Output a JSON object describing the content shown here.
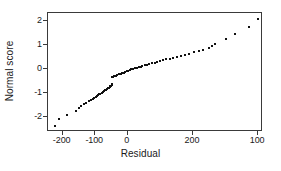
{
  "chart_data": {
    "type": "scatter",
    "title": "",
    "subtitle": "",
    "xlabel": "Residual",
    "ylabel": "Normal score",
    "xlim": [
      -245,
      415
    ],
    "ylim": [
      -2.62,
      2.33
    ],
    "grid": false,
    "legend": null,
    "annotations": [],
    "xticks": [
      {
        "value": -200,
        "label": "-200"
      },
      {
        "value": -100,
        "label": "-100"
      },
      {
        "value": 0,
        "label": "0"
      },
      {
        "value": 200,
        "label": "200"
      },
      {
        "value": 400,
        "label": "100"
      }
    ],
    "yticks": [
      {
        "value": 2,
        "label": "2"
      },
      {
        "value": 1,
        "label": "1"
      },
      {
        "value": 0,
        "label": "0"
      },
      {
        "value": -1,
        "label": "-1"
      },
      {
        "value": -2,
        "label": "-2"
      }
    ],
    "marker": "square",
    "marker_color": "#111111",
    "marker_size": 2,
    "n_points": 75,
    "series": [
      {
        "name": "residual-quantiles",
        "x": [
          -224,
          -210,
          -188,
          -160,
          -151,
          -143,
          -136,
          -128,
          -120,
          -113,
          -108,
          -104,
          -99,
          -96,
          -92,
          -88,
          -84,
          -80,
          -76,
          -73,
          -70,
          -67,
          -64,
          -61,
          -58,
          -56,
          -54,
          -52,
          -50,
          -49,
          -48,
          -46,
          -42,
          -37,
          -32,
          -27,
          -22,
          -17,
          -12,
          -8,
          -4,
          1,
          6,
          11,
          16,
          21,
          27,
          33,
          39,
          45,
          52,
          59,
          66,
          74,
          82,
          90,
          99,
          108,
          118,
          128,
          139,
          150,
          162,
          175,
          188,
          202,
          217,
          232,
          248,
          258,
          268,
          300,
          330,
          372,
          400
        ],
        "y": [
          -2.38,
          -2.07,
          -1.93,
          -1.73,
          -1.62,
          -1.54,
          -1.47,
          -1.41,
          -1.35,
          -1.3,
          -1.25,
          -1.21,
          -1.17,
          -1.13,
          -1.09,
          -1.05,
          -1.02,
          -0.98,
          -0.95,
          -0.92,
          -0.89,
          -0.86,
          -0.83,
          -0.8,
          -0.77,
          -0.74,
          -0.71,
          -0.69,
          -0.66,
          -0.63,
          -0.35,
          -0.32,
          -0.3,
          -0.27,
          -0.25,
          -0.22,
          -0.2,
          -0.17,
          -0.15,
          -0.12,
          -0.1,
          -0.07,
          -0.05,
          -0.02,
          0.0,
          0.03,
          0.05,
          0.08,
          0.1,
          0.13,
          0.16,
          0.18,
          0.21,
          0.24,
          0.27,
          0.3,
          0.33,
          0.36,
          0.4,
          0.43,
          0.47,
          0.51,
          0.55,
          0.59,
          0.64,
          0.69,
          0.74,
          0.8,
          0.87,
          0.94,
          1.03,
          1.26,
          1.45,
          1.75,
          2.08
        ]
      }
    ]
  }
}
